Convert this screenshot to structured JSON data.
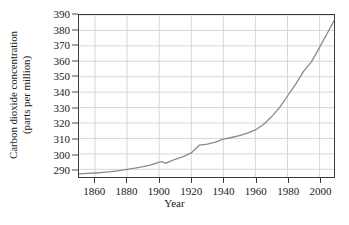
{
  "chart_data": {
    "type": "line",
    "title": "",
    "xlabel": "Year",
    "ylabel": "Carbon dioxide concentration (parts per million)",
    "ylabel_line1": "Carbon dioxide concentration",
    "ylabel_line2": "(parts per million)",
    "xlim": [
      1850,
      2009
    ],
    "ylim": [
      285,
      390
    ],
    "xticks": [
      1860,
      1880,
      1900,
      1920,
      1940,
      1960,
      1980,
      2000
    ],
    "yticks": [
      290,
      300,
      310,
      320,
      330,
      340,
      350,
      360,
      370,
      380,
      390
    ],
    "grid": true,
    "legend": "none",
    "series": [
      {
        "name": "Atmospheric CO2 concentration",
        "color": "#8a8a8a",
        "x": [
          1850,
          1855,
          1860,
          1865,
          1870,
          1875,
          1880,
          1885,
          1890,
          1895,
          1900,
          1902,
          1904,
          1906,
          1910,
          1915,
          1920,
          1925,
          1930,
          1935,
          1940,
          1945,
          1950,
          1955,
          1960,
          1965,
          1970,
          1975,
          1980,
          1985,
          1990,
          1995,
          2000,
          2005,
          2009
        ],
        "values": [
          287.0,
          287.3,
          287.6,
          288.0,
          288.5,
          289.2,
          290.0,
          290.8,
          291.7,
          292.8,
          294.6,
          294.9,
          293.8,
          294.8,
          296.5,
          298.2,
          300.6,
          305.6,
          306.3,
          307.6,
          309.5,
          310.6,
          311.8,
          313.4,
          315.5,
          319.0,
          324.0,
          330.0,
          337.5,
          345.0,
          353.5,
          359.8,
          369.0,
          378.5,
          386.2
        ]
      }
    ],
    "annotations": []
  },
  "axes": {
    "y_title_line1": "Carbon dioxide concentration",
    "y_title_line2": "(parts per million)",
    "x_title": "Year",
    "y_tick_labels": [
      "390",
      "380",
      "370",
      "360",
      "350",
      "340",
      "330",
      "320",
      "310",
      "300",
      "290"
    ],
    "x_tick_labels": [
      "1860",
      "1880",
      "1900",
      "1920",
      "1940",
      "1960",
      "1980",
      "2000"
    ]
  },
  "style": {
    "line_color": "#8a8a8a",
    "grid_color": "#d8d8d8",
    "axis_color": "#3a3a3a",
    "background": "#ffffff",
    "text_color": "#1a1a1a"
  }
}
